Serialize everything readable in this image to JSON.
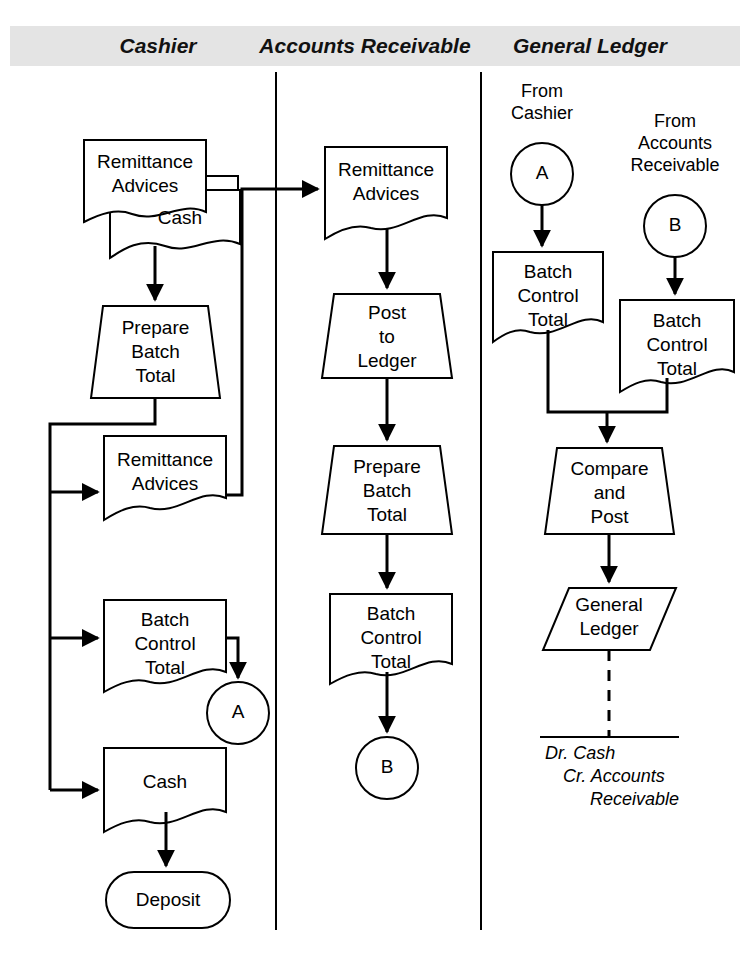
{
  "diagram": {
    "colors": {
      "band_background": "#e4e4e4",
      "line": "#000000",
      "shape_fill": "#ffffff",
      "text": "#000000"
    },
    "columns": [
      {
        "id": "cashier",
        "label": "Cashier"
      },
      {
        "id": "accounts_receivable",
        "label": "Accounts Receivable"
      },
      {
        "id": "general_ledger",
        "label": "General Ledger"
      }
    ],
    "cashier": {
      "doc_remittance_advices": "Remittance\nAdvices",
      "doc_cash_behind": "Cash",
      "process_prepare_batch_total": "Prepare\nBatch\nTotal",
      "doc_remittance_advices_2": "Remittance\nAdvices",
      "doc_batch_control_total": "Batch\nControl\nTotal",
      "connector_a": "A",
      "doc_cash": "Cash",
      "terminator_deposit": "Deposit"
    },
    "accounts_receivable": {
      "doc_remittance_advices": "Remittance\nAdvices",
      "process_post_to_ledger": "Post\nto\nLedger",
      "process_prepare_batch_total": "Prepare\nBatch\nTotal",
      "doc_batch_control_total": "Batch\nControl\nTotal",
      "connector_b": "B"
    },
    "general_ledger": {
      "from_cashier_label": "From\nCashier",
      "connector_a": "A",
      "from_accounts_receivable_label": "From\nAccounts\nReceivable",
      "connector_b": "B",
      "doc_batch_control_total_left": "Batch\nControl\nTotal",
      "doc_batch_control_total_right": "Batch\nControl\nTotal",
      "process_compare_and_post": "Compare\nand\nPost",
      "data_general_ledger": "General\nLedger",
      "journal_entry": {
        "line1": "Dr. Cash",
        "line2": "Cr. Accounts",
        "line3": "Receivable"
      }
    }
  }
}
